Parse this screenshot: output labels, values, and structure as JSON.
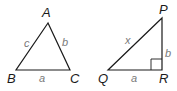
{
  "triangles": [
    {
      "vertices": {
        "A": "A",
        "B": "B",
        "C": "C"
      },
      "sides": {
        "c": "c",
        "b": "b",
        "a": "a"
      }
    },
    {
      "vertices": {
        "P": "P",
        "Q": "Q",
        "R": "R"
      },
      "sides": {
        "x": "x",
        "b": "b",
        "a": "a"
      },
      "right_angle_at": "R"
    }
  ]
}
